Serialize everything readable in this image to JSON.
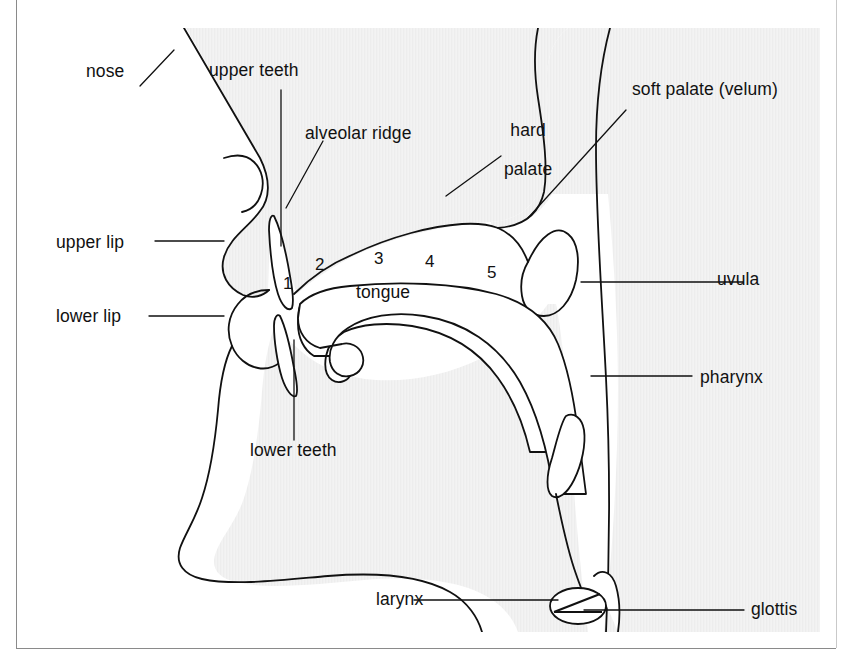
{
  "figure": {
    "title_partial": "",
    "type": "anatomical-diagram",
    "background_color": "#ffffff",
    "fill_color": "#f2f2f2",
    "line_color": "#111111",
    "border_color": "#3a3a3a"
  },
  "labels": {
    "nose": "nose",
    "upper_teeth": "upper teeth",
    "alveolar_ridge": "alveolar ridge",
    "hard_palate": "hard\npalate",
    "hard_palate_line1": "hard",
    "hard_palate_line2": "palate",
    "soft_palate": "soft palate (velum)",
    "upper_lip": "upper lip",
    "lower_lip": "lower lip",
    "tongue": "tongue",
    "uvula": "uvula",
    "pharynx": "pharynx",
    "lower_teeth": "lower teeth",
    "larynx": "larynx",
    "glottis": "glottis"
  },
  "tongue_points": [
    {
      "id": "1",
      "label": "1"
    },
    {
      "id": "2",
      "label": "2"
    },
    {
      "id": "3",
      "label": "3"
    },
    {
      "id": "4",
      "label": "4"
    },
    {
      "id": "5",
      "label": "5"
    }
  ]
}
